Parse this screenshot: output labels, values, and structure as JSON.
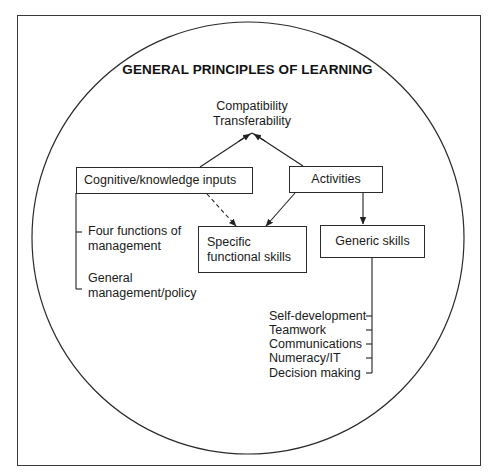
{
  "diagram": {
    "title": "GENERAL PRINCIPLES OF LEARNING",
    "top_node": {
      "line1": "Compatibility",
      "line2": "Transferability"
    },
    "boxes": {
      "cognitive": "Cognitive/knowledge inputs",
      "activities": "Activities",
      "specific": {
        "line1": "Specific",
        "line2": "functional skills"
      },
      "generic": "Generic skills"
    },
    "cognitive_branches": [
      {
        "line1": "Four functions of",
        "line2": "management"
      },
      {
        "line1": "General",
        "line2": "management/policy"
      }
    ],
    "generic_skills": [
      "Self-development",
      "Teamwork",
      "Communications",
      "Numeracy/IT",
      "Decision making"
    ],
    "edges": [
      {
        "from": "Cognitive/knowledge inputs",
        "to": "Compatibility/Transferability",
        "style": "solid"
      },
      {
        "from": "Activities",
        "to": "Compatibility/Transferability",
        "style": "solid"
      },
      {
        "from": "Cognitive/knowledge inputs",
        "to": "Specific functional skills",
        "style": "dashed"
      },
      {
        "from": "Activities",
        "to": "Specific functional skills",
        "style": "solid"
      },
      {
        "from": "Activities",
        "to": "Generic skills",
        "style": "solid"
      }
    ],
    "colors": {
      "line": "#2a2a2a",
      "background": "#ffffff",
      "text": "#1a1a1a"
    }
  }
}
